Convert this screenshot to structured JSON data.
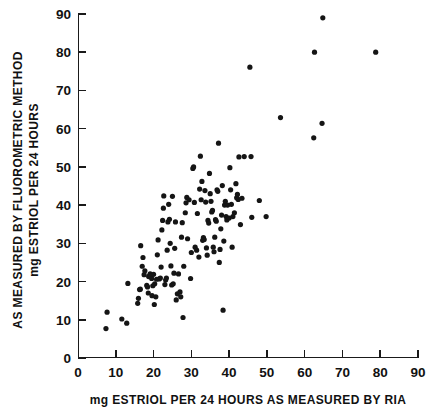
{
  "chart_data": {
    "type": "scatter",
    "title": "",
    "subtitle": "",
    "xlabel": "mg ESTRIOL PER 24 HOURS AS MEASURED BY  RIA",
    "ylabel_line1": "mg ESTRIOL PER 24 HOURS",
    "ylabel_line2": "AS MEASURED BY FLUOROMETRIC METHOD",
    "xlim": [
      0,
      90
    ],
    "ylim": [
      0,
      90
    ],
    "xticks": [
      0,
      10,
      20,
      30,
      40,
      50,
      60,
      70,
      80,
      90
    ],
    "yticks": [
      0,
      10,
      20,
      30,
      40,
      50,
      60,
      70,
      80,
      90
    ],
    "xticklabels": [
      "0",
      "10",
      "20",
      "30",
      "40",
      "50",
      "60",
      "70",
      "80",
      "90"
    ],
    "yticklabels": [
      "0",
      "10",
      "20",
      "30",
      "40",
      "50",
      "60",
      "70",
      "80",
      "90"
    ],
    "grid": false,
    "legend": null,
    "marker": "circle",
    "marker_color": "#151515",
    "marker_size": 2.6,
    "series": [
      {
        "name": "estriol measurements",
        "points": [
          [
            7.4,
            7.7
          ],
          [
            7.7,
            12.0
          ],
          [
            11.6,
            10.2
          ],
          [
            12.9,
            9.1
          ],
          [
            13.2,
            19.5
          ],
          [
            15.8,
            14.3
          ],
          [
            16.0,
            15.6
          ],
          [
            16.3,
            17.9
          ],
          [
            16.5,
            18.0
          ],
          [
            16.6,
            29.4
          ],
          [
            17.0,
            24.0
          ],
          [
            17.2,
            26.3
          ],
          [
            17.5,
            21.8
          ],
          [
            17.7,
            22.8
          ],
          [
            18.2,
            19.0
          ],
          [
            18.4,
            18.6
          ],
          [
            18.6,
            17.0
          ],
          [
            18.7,
            21.3
          ],
          [
            19.0,
            21.6
          ],
          [
            19.1,
            22.0
          ],
          [
            19.2,
            21.5
          ],
          [
            19.3,
            21.4
          ],
          [
            19.5,
            20.8
          ],
          [
            19.6,
            16.3
          ],
          [
            19.8,
            18.9
          ],
          [
            20.0,
            21.9
          ],
          [
            20.2,
            14.0
          ],
          [
            20.3,
            19.4
          ],
          [
            20.6,
            16.0
          ],
          [
            20.8,
            20.6
          ],
          [
            21.0,
            27.0
          ],
          [
            21.2,
            30.9
          ],
          [
            21.5,
            20.7
          ],
          [
            21.8,
            20.9
          ],
          [
            22.0,
            23.8
          ],
          [
            22.2,
            33.5
          ],
          [
            22.4,
            36.0
          ],
          [
            22.6,
            39.2
          ],
          [
            22.7,
            42.4
          ],
          [
            23.0,
            19.2
          ],
          [
            23.2,
            20.4
          ],
          [
            23.4,
            20.9
          ],
          [
            23.6,
            28.2
          ],
          [
            23.8,
            35.6
          ],
          [
            24.0,
            40.2
          ],
          [
            24.2,
            36.3
          ],
          [
            24.4,
            30.0
          ],
          [
            24.6,
            24.1
          ],
          [
            24.8,
            19.1
          ],
          [
            25.0,
            42.3
          ],
          [
            25.2,
            19.4
          ],
          [
            25.4,
            22.2
          ],
          [
            25.6,
            28.7
          ],
          [
            25.8,
            35.6
          ],
          [
            26.0,
            15.2
          ],
          [
            26.3,
            16.8
          ],
          [
            26.6,
            22.0
          ],
          [
            27.0,
            17.3
          ],
          [
            27.2,
            16.0
          ],
          [
            27.4,
            31.6
          ],
          [
            27.6,
            35.4
          ],
          [
            27.8,
            10.6
          ],
          [
            28.0,
            24.0
          ],
          [
            28.4,
            38.0
          ],
          [
            28.6,
            40.6
          ],
          [
            28.8,
            42.0
          ],
          [
            29.0,
            31.2
          ],
          [
            29.4,
            41.4
          ],
          [
            29.8,
            20.8
          ],
          [
            30.0,
            27.6
          ],
          [
            30.4,
            49.6
          ],
          [
            30.6,
            50.0
          ],
          [
            30.8,
            40.7
          ],
          [
            31.0,
            29.0
          ],
          [
            31.4,
            28.2
          ],
          [
            31.6,
            37.8
          ],
          [
            32.0,
            26.4
          ],
          [
            32.2,
            44.2
          ],
          [
            32.4,
            52.8
          ],
          [
            32.6,
            41.4
          ],
          [
            32.8,
            46.2
          ],
          [
            33.0,
            30.8
          ],
          [
            33.2,
            31.5
          ],
          [
            33.4,
            31.0
          ],
          [
            33.6,
            43.8
          ],
          [
            33.8,
            40.8
          ],
          [
            34.0,
            28.8
          ],
          [
            34.2,
            26.9
          ],
          [
            34.4,
            36.0
          ],
          [
            34.6,
            35.3
          ],
          [
            34.8,
            48.3
          ],
          [
            35.0,
            43.0
          ],
          [
            35.2,
            41.0
          ],
          [
            35.4,
            38.2
          ],
          [
            35.6,
            38.6
          ],
          [
            35.8,
            29.0
          ],
          [
            36.0,
            27.8
          ],
          [
            36.2,
            31.6
          ],
          [
            36.4,
            36.2
          ],
          [
            36.6,
            35.8
          ],
          [
            36.8,
            44.0
          ],
          [
            37.0,
            43.6
          ],
          [
            37.2,
            56.2
          ],
          [
            37.4,
            25.0
          ],
          [
            37.6,
            28.4
          ],
          [
            37.8,
            33.8
          ],
          [
            38.0,
            37.4
          ],
          [
            38.2,
            45.1
          ],
          [
            38.4,
            12.5
          ],
          [
            38.6,
            30.6
          ],
          [
            38.8,
            40.0
          ],
          [
            39.0,
            41.0
          ],
          [
            39.2,
            37.0
          ],
          [
            39.4,
            36.1
          ],
          [
            39.6,
            40.0
          ],
          [
            40.0,
            36.6
          ],
          [
            40.2,
            49.8
          ],
          [
            40.4,
            44.0
          ],
          [
            40.6,
            40.2
          ],
          [
            40.8,
            29.0
          ],
          [
            41.0,
            37.0
          ],
          [
            41.4,
            38.0
          ],
          [
            41.8,
            45.6
          ],
          [
            42.0,
            41.9
          ],
          [
            42.2,
            42.8
          ],
          [
            42.4,
            41.5
          ],
          [
            42.6,
            52.6
          ],
          [
            43.0,
            34.9
          ],
          [
            43.4,
            41.8
          ],
          [
            44.0,
            52.7
          ],
          [
            45.8,
            52.7
          ],
          [
            46.0,
            36.8
          ],
          [
            48.0,
            41.2
          ],
          [
            49.8,
            37.0
          ],
          [
            45.5,
            76.1
          ],
          [
            53.6,
            62.9
          ],
          [
            62.4,
            57.6
          ],
          [
            62.6,
            80.0
          ],
          [
            64.6,
            61.4
          ],
          [
            64.8,
            89.0
          ],
          [
            78.8,
            80.0
          ]
        ]
      }
    ],
    "geometry": {
      "plot_left_px": 78,
      "plot_right_px": 418,
      "plot_bottom_px": 358,
      "plot_top_px": 14
    }
  }
}
